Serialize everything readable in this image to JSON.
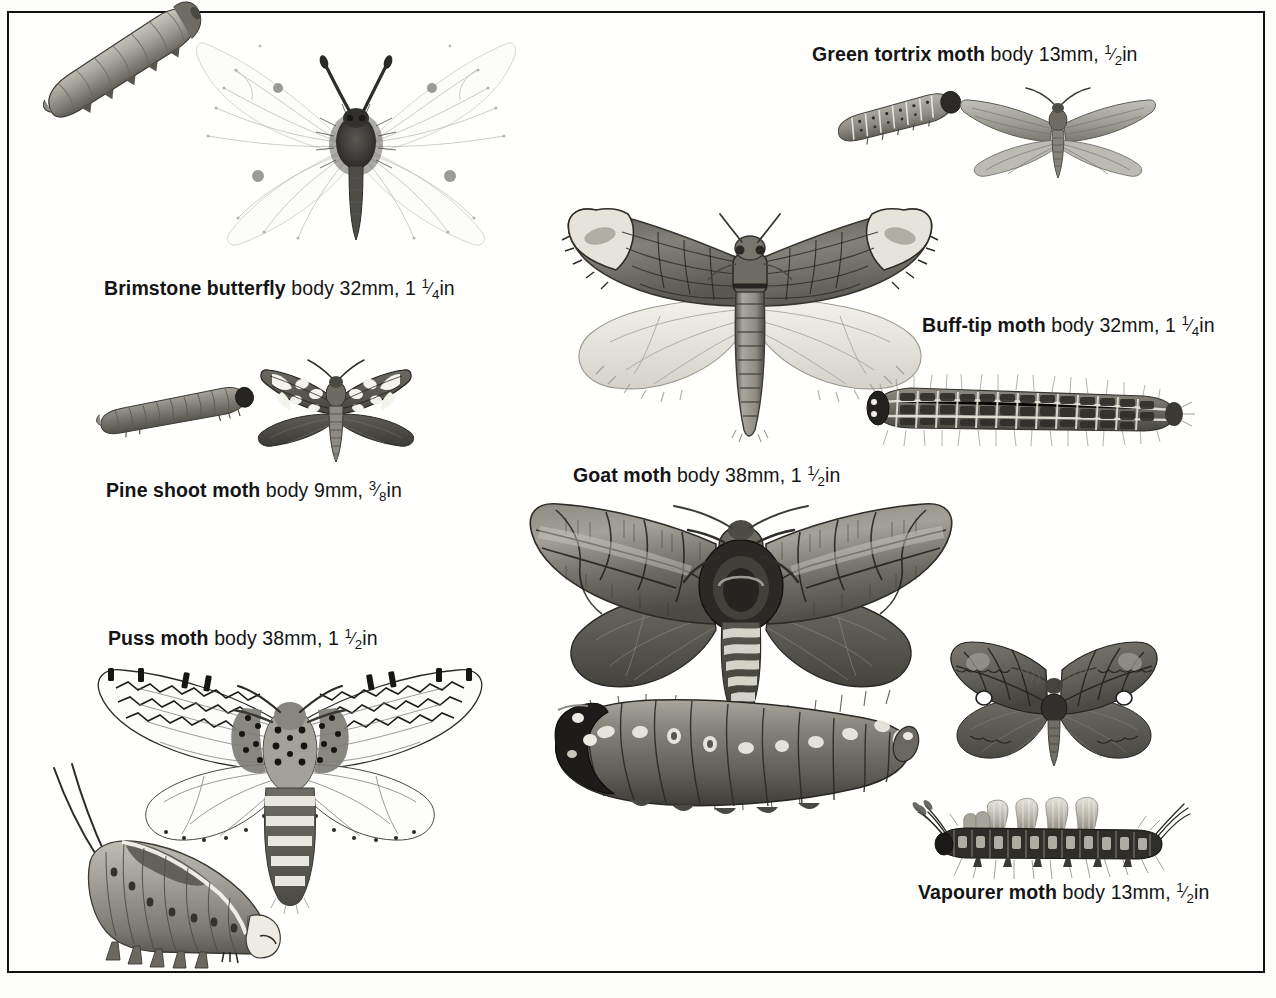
{
  "plate": {
    "title": "Moth and butterfly caterpillars and adults identification plate",
    "background_color": "#fdfdfc",
    "border_color": "#111111",
    "illustration_style": "monochrome pencil / engraving, grayscale"
  },
  "species": [
    {
      "id": "brimstone-butterfly",
      "common_name": "Brimstone butterfly",
      "name_label": "Brimstone butterfly",
      "detail_label": "body 32mm, 1",
      "fraction_numerator": "1",
      "fraction_denominator": "4",
      "unit_suffix": "in",
      "body_mm": 32,
      "body_in": "1 1/4",
      "caption_full": "Brimstone butterfly body 32mm, 1 1/4in",
      "caption_x": 104,
      "caption_y": 276,
      "adult_colors": [
        "#f6f6f4",
        "#8d8d8a",
        "#3a3a38"
      ],
      "larva_colors": [
        "#9b998f",
        "#55534c"
      ]
    },
    {
      "id": "green-tortrix-moth",
      "common_name": "Green tortrix moth",
      "name_label": "Green tortrix moth",
      "detail_label": "body 13mm, ",
      "fraction_numerator": "1",
      "fraction_denominator": "2",
      "unit_suffix": "in",
      "body_mm": 13,
      "body_in": "1/2",
      "caption_full": "Green tortrix moth body 13mm, 1/2in",
      "caption_x": 812,
      "caption_y": 42,
      "adult_colors": [
        "#a9a9a4",
        "#6f6f69",
        "#3d3d39"
      ],
      "larva_colors": [
        "#8f8d85",
        "#2b2a27"
      ]
    },
    {
      "id": "buff-tip-moth",
      "common_name": "Buff-tip moth",
      "name_label": "Buff-tip moth",
      "detail_label": "body 32mm, 1",
      "fraction_numerator": "1",
      "fraction_denominator": "4",
      "unit_suffix": "in",
      "body_mm": 32,
      "body_in": "1 1/4",
      "caption_full": "Buff-tip moth body 32mm, 1 1/4in",
      "caption_x": 922,
      "caption_y": 313,
      "adult_colors": [
        "#6b6b66",
        "#d9d8d2",
        "#2f2f2c"
      ],
      "larva_colors": [
        "#514f49",
        "#cfccc2"
      ]
    },
    {
      "id": "pine-shoot-moth",
      "common_name": "Pine shoot moth",
      "name_label": "Pine shoot moth",
      "detail_label": "body 9mm, ",
      "fraction_numerator": "3",
      "fraction_denominator": "8",
      "unit_suffix": "in",
      "body_mm": 9,
      "body_in": "3/8",
      "caption_full": "Pine shoot moth body 9mm, 3/8in",
      "caption_x": 106,
      "caption_y": 478,
      "adult_colors": [
        "#585652",
        "#ececea",
        "#2b2a28"
      ],
      "larva_colors": [
        "#7e7c74",
        "#262523"
      ]
    },
    {
      "id": "goat-moth",
      "common_name": "Goat moth",
      "name_label": "Goat moth",
      "detail_label": "body 38mm, 1",
      "fraction_numerator": "1",
      "fraction_denominator": "2",
      "unit_suffix": "in",
      "body_mm": 38,
      "body_in": "1 1/2",
      "caption_full": "Goat moth body 38mm, 1 1/2in",
      "caption_x": 573,
      "caption_y": 463,
      "adult_colors": [
        "#7a776f",
        "#48453f",
        "#e2e0d8"
      ],
      "larva_colors": [
        "#6e6b64",
        "#1d1c1a"
      ]
    },
    {
      "id": "puss-moth",
      "common_name": "Puss moth",
      "name_label": "Puss moth",
      "detail_label": "body 38mm, 1",
      "fraction_numerator": "1",
      "fraction_denominator": "2",
      "unit_suffix": "in",
      "body_mm": 38,
      "body_in": "1 1/2",
      "caption_full": "Puss moth body 38mm, 1 1/2in",
      "caption_x": 108,
      "caption_y": 626,
      "adult_colors": [
        "#fbfbfa",
        "#1d1d1b",
        "#8c8a84"
      ],
      "larva_colors": [
        "#a9a79d",
        "#5d5b54"
      ]
    },
    {
      "id": "vapourer-moth",
      "common_name": "Vapourer moth",
      "name_label": "Vapourer moth",
      "detail_label": "body 13mm, ",
      "fraction_numerator": "1",
      "fraction_denominator": "2",
      "unit_suffix": "in",
      "body_mm": 13,
      "body_in": "1/2",
      "caption_full": "Vapourer moth body 13mm, 1/2in",
      "caption_x": 918,
      "caption_y": 880,
      "adult_colors": [
        "#6d6a63",
        "#3a3833",
        "#ffffff"
      ],
      "larva_colors": [
        "#33312d",
        "#b9b6ad"
      ]
    }
  ]
}
